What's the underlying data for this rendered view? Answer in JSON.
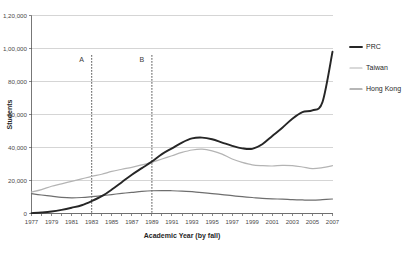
{
  "chart_data": {
    "type": "line",
    "title": "",
    "xlabel": "Academic Year (by fall)",
    "ylabel": "Students",
    "grid": true,
    "legend_position": "right",
    "ylim": [
      0,
      120000
    ],
    "yticks": [
      0,
      20000,
      40000,
      60000,
      80000,
      100000,
      120000
    ],
    "ytick_labels": [
      "0",
      "20,000",
      "40,000",
      "60,000",
      "80,000",
      "1,00,000",
      "1,20,000"
    ],
    "xlim": [
      1977,
      2007
    ],
    "x": [
      1977,
      1978,
      1979,
      1980,
      1981,
      1982,
      1983,
      1984,
      1985,
      1986,
      1987,
      1988,
      1989,
      1990,
      1991,
      1992,
      1993,
      1994,
      1995,
      1996,
      1997,
      1998,
      1999,
      2000,
      2001,
      2002,
      2003,
      2004,
      2005,
      2006,
      2007
    ],
    "xtick_labels": [
      "1977",
      "1979",
      "1981",
      "1983",
      "1985",
      "1987",
      "1989",
      "1991",
      "1993",
      "1995",
      "1997",
      "1999",
      "2001",
      "2003",
      "2005",
      "2007"
    ],
    "series": [
      {
        "name": "PRC",
        "color": "#262626",
        "width": 1.9,
        "values": [
          200,
          600,
          1200,
          2200,
          3500,
          5000,
          7500,
          10500,
          14500,
          19000,
          23500,
          27500,
          31500,
          36000,
          39500,
          43000,
          45500,
          46000,
          45000,
          43000,
          41000,
          39500,
          39200,
          42000,
          47000,
          52000,
          57500,
          61500,
          62500,
          67500,
          98000
        ]
      },
      {
        "name": "Taiwan",
        "color": "#b4b4b4",
        "width": 1.2,
        "values": [
          13000,
          14500,
          16500,
          18000,
          19500,
          21000,
          22500,
          23800,
          25500,
          26800,
          28000,
          29500,
          31000,
          33000,
          35000,
          37000,
          38500,
          39000,
          38000,
          36000,
          33000,
          31000,
          29500,
          29000,
          28800,
          29200,
          29000,
          28200,
          27200,
          27800,
          29000
        ]
      },
      {
        "name": "Hong Kong",
        "color": "#6e6e6e",
        "width": 1.2,
        "values": [
          12000,
          11200,
          10500,
          9800,
          9500,
          9700,
          10200,
          10800,
          11500,
          12200,
          12800,
          13400,
          13800,
          13900,
          13800,
          13600,
          13200,
          12700,
          12100,
          11500,
          10800,
          10200,
          9700,
          9200,
          8900,
          8700,
          8400,
          8200,
          8100,
          8400,
          8800
        ]
      }
    ],
    "annotations": [
      {
        "label": "A",
        "x": 1983,
        "label_y": 92000
      },
      {
        "label": "B",
        "x": 1989,
        "label_y": 92000
      }
    ]
  }
}
